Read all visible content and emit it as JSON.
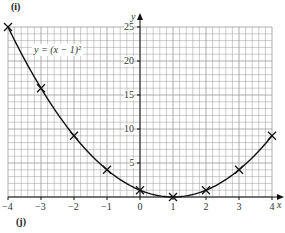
{
  "panel_labels": {
    "top": "(i)",
    "bottom": "(j)"
  },
  "chart_data": {
    "type": "line",
    "title": "",
    "equation_label": "y = (x − 1)²",
    "xlabel": "x",
    "ylabel": "y",
    "x": [
      -4,
      -3,
      -2,
      -1,
      0,
      1,
      2,
      3,
      4
    ],
    "series": [
      {
        "name": "y = (x − 1)²",
        "values": [
          25,
          16,
          9,
          4,
          1,
          0,
          1,
          4,
          9
        ],
        "marker": "x",
        "curve": "smooth"
      }
    ],
    "xlim": [
      -4,
      4
    ],
    "ylim": [
      0,
      25
    ],
    "x_ticks": [
      "−4",
      "−3",
      "−2",
      "−1",
      "0",
      "1",
      "2",
      "3",
      "4"
    ],
    "y_ticks": [
      "5",
      "10",
      "15",
      "20",
      "25"
    ],
    "grid": true,
    "grid_minor_x_per_unit": 5,
    "grid_minor_y_step": 1,
    "legend": "none"
  },
  "colors": {
    "curve": "#111111",
    "grid": "#9a9a9a",
    "axis": "#111111",
    "text": "#333333"
  }
}
